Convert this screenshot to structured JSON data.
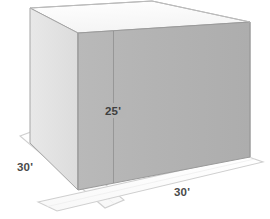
{
  "diagram": {
    "units": "feet",
    "shape_kind": "rectangular-prism",
    "faces": {
      "top": {
        "name": "top-face",
        "color": "#fbfbfb"
      },
      "left": {
        "name": "left-face",
        "color": "#e3e3e3"
      },
      "front": {
        "name": "front-face",
        "color": "#b4b4b4"
      }
    },
    "background_color": "#ffffff",
    "edge_color": "#9a9a9a",
    "dimension_band_color": "#fdfdfd",
    "dimension_band_edge_color": "#c9c9c9",
    "seam_color": "#8f8f8f",
    "labels": {
      "height": "25'",
      "depth": "30'",
      "width": "30'"
    },
    "measurements": [
      {
        "name": "height",
        "label": "25'",
        "value": 25,
        "unit": "ft",
        "placement": "front-face-vertical"
      },
      {
        "name": "depth",
        "label": "30'",
        "value": 30,
        "unit": "ft",
        "placement": "left-ground-band"
      },
      {
        "name": "width",
        "label": "30'",
        "value": 30,
        "unit": "ft",
        "placement": "bottom-ground-band"
      }
    ]
  }
}
